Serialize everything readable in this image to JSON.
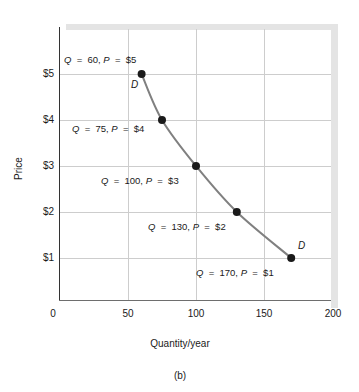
{
  "chart_data": {
    "type": "line",
    "title": "",
    "caption": "(b)",
    "xlabel": "Quantity/year",
    "ylabel": "Price",
    "xlim": [
      0,
      200
    ],
    "ylim": [
      0,
      6
    ],
    "grid": true,
    "legend": null,
    "series_label": "D",
    "x": [
      60,
      75,
      100,
      130,
      170
    ],
    "values": [
      5,
      4,
      3,
      2,
      1
    ],
    "xticks": [
      "0",
      "50",
      "100",
      "150",
      "200"
    ],
    "xtick_values": [
      0,
      50,
      100,
      150,
      200
    ],
    "yticks": [
      "$1",
      "$2",
      "$3",
      "$4",
      "$5"
    ],
    "ytick_values": [
      1,
      2,
      3,
      4,
      5
    ],
    "points": [
      {
        "q": 60,
        "p": 5,
        "label": "Q  =  60, P  =  $5",
        "q_text": "60",
        "p_text": "$5"
      },
      {
        "q": 75,
        "p": 4,
        "label": "Q  =  75, P  =  $4",
        "q_text": "75",
        "p_text": "$4"
      },
      {
        "q": 100,
        "p": 3,
        "label": "Q  =  100, P  =  $3",
        "q_text": "100",
        "p_text": "$3"
      },
      {
        "q": 130,
        "p": 2,
        "label": "Q  =  130, P  =  $2",
        "q_text": "130",
        "p_text": "$2"
      },
      {
        "q": 170,
        "p": 1,
        "label": "Q  =  170, P  =  $1",
        "q_text": "170",
        "p_text": "$1"
      }
    ],
    "curve_tags": [
      {
        "text": "D",
        "anchor": "upper-left-of-first-point"
      },
      {
        "text": "D",
        "anchor": "upper-right-of-last-point"
      }
    ],
    "colors": {
      "curve": "#808080",
      "marker": "#1a1a1a",
      "grid": "#cdcdcd",
      "axis": "#333333",
      "band": "#e4e4e4",
      "background": "#ffffff",
      "text": "#1a1a1a"
    }
  }
}
